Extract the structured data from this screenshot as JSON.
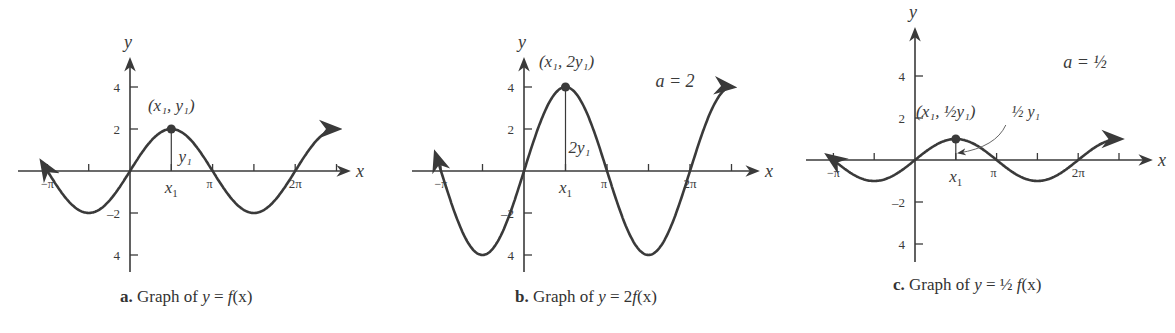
{
  "chart_data": [
    {
      "type": "line",
      "panel": "a",
      "title": "Graph of y = f(x)",
      "caption_letter": "a.",
      "caption_text": "Graph of",
      "caption_eq": "y = f(x)",
      "function": "y = 2 sin(x)",
      "xlabel": "x",
      "ylabel": "y",
      "x_ticks": [
        "−π",
        "x1",
        "π",
        "2π"
      ],
      "y_ticks": [
        "4",
        "2",
        "−2",
        "4"
      ],
      "xlim": [
        -3.6,
        8.4
      ],
      "ylim": [
        -4.5,
        4.5
      ],
      "amplitude": 2,
      "point": {
        "label": "(x1, y1)",
        "x": 1.5708,
        "y": 2
      },
      "segment_label": "y1"
    },
    {
      "type": "line",
      "panel": "b",
      "title": "Graph of y = 2f(x)",
      "caption_letter": "b.",
      "caption_text": "Graph of",
      "caption_eq": "y = 2f(x)",
      "function": "y = 4 sin(x)",
      "xlabel": "x",
      "ylabel": "y",
      "x_ticks": [
        "−π",
        "x1",
        "π",
        "2π"
      ],
      "y_ticks": [
        "4",
        "2",
        "−2",
        "4"
      ],
      "xlim": [
        -3.6,
        8.4
      ],
      "ylim": [
        -4.5,
        4.5
      ],
      "amplitude": 4,
      "annotation": "a = 2",
      "point": {
        "label": "(x1, 2y1)",
        "x": 1.5708,
        "y": 4
      },
      "segment_label": "2y1"
    },
    {
      "type": "line",
      "panel": "c",
      "title": "Graph of y = 1/2 f(x)",
      "caption_letter": "c.",
      "caption_text": "Graph of",
      "caption_eq": "y = ½ f(x)",
      "function": "y = sin(x)",
      "xlabel": "x",
      "ylabel": "y",
      "x_ticks": [
        "−π",
        "x1",
        "π",
        "2π"
      ],
      "y_ticks": [
        "4",
        "2",
        "−2",
        "4"
      ],
      "xlim": [
        -3.6,
        8.4
      ],
      "ylim": [
        -4.5,
        4.5
      ],
      "amplitude": 1,
      "annotation": "a = 1/2",
      "point": {
        "label": "(x1, ½y1)",
        "x": 1.5708,
        "y": 1
      },
      "segment_label": "½ y1"
    }
  ],
  "captions": {
    "a": {
      "letter": "a.",
      "text": " Graph of ",
      "y": "y",
      "eq": " = ",
      "f": "f",
      "rest": "(x)"
    },
    "b": {
      "letter": "b.",
      "text": " Graph of ",
      "y": "y",
      "eq": " = 2",
      "f": "f",
      "rest": "(x)"
    },
    "c": {
      "letter": "c.",
      "text": " Graph of ",
      "y": "y",
      "eq": " = ½ ",
      "f": "f",
      "rest": "(x)"
    }
  },
  "colors": {
    "curve": "#3a3a3a",
    "axis": "#3a3a3a",
    "text": "#333333"
  }
}
